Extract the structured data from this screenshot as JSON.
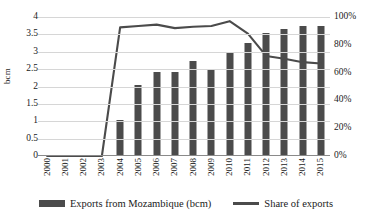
{
  "chart_data": {
    "type": "bar",
    "title": "",
    "subtitle": "",
    "xlabel": "",
    "ylabel": "bcm",
    "y2label": "",
    "grid": true,
    "legend_position": "bottom",
    "categories": [
      "2000",
      "2001",
      "2002",
      "2003",
      "2004",
      "2005",
      "2006",
      "2007",
      "2008",
      "2009",
      "2010",
      "2011",
      "2012",
      "2013",
      "2014",
      "2015"
    ],
    "ylim": [
      0,
      4
    ],
    "y2lim": [
      0,
      100
    ],
    "yticks": [
      "0",
      "0.5",
      "1",
      "1.5",
      "2",
      "2.5",
      "3",
      "3.5",
      "4"
    ],
    "ytick_values": [
      0,
      0.5,
      1,
      1.5,
      2,
      2.5,
      3,
      3.5,
      4
    ],
    "y2ticks": [
      "0%",
      "20%",
      "40%",
      "60%",
      "80%",
      "100%"
    ],
    "y2tick_values": [
      0,
      20,
      40,
      60,
      80,
      100
    ],
    "series": [
      {
        "name": "Exports from Mozambique (bcm)",
        "type": "bar",
        "axis": "left",
        "color": "#4b4b4b",
        "values": [
          0,
          0,
          0,
          0,
          1.05,
          2.05,
          2.42,
          2.42,
          2.72,
          2.5,
          2.99,
          3.26,
          3.55,
          3.65,
          3.73,
          3.73
        ]
      },
      {
        "name": "Share of exports",
        "type": "line",
        "axis": "right",
        "color": "#4b4b4b",
        "values": [
          0,
          0,
          0,
          0,
          92.5,
          93.5,
          94.5,
          92,
          93,
          93.5,
          97,
          88,
          72,
          70,
          67.5,
          66.5
        ]
      }
    ]
  },
  "legend": {
    "items": [
      {
        "label": "Exports from Mozambique (bcm)",
        "marker": "bar-swatch"
      },
      {
        "label": "Share of exports",
        "marker": "line-swatch"
      }
    ]
  }
}
